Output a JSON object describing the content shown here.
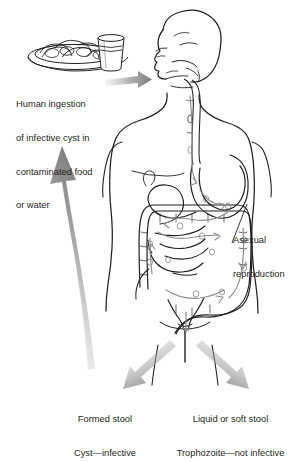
{
  "figure": {
    "background_color": "#ffffff",
    "line_color": "#231f20",
    "arrow_color": "#8d8d8d",
    "text_color": "#231f20"
  },
  "labels": {
    "ingestion": {
      "name": "human-ingestion-caption",
      "lines": [
        "Human ingestion",
        "of infective cyst in",
        "contaminated food",
        "or water"
      ]
    },
    "asexual": {
      "name": "asexual-reproduction-caption",
      "lines": [
        "Asexual",
        "reproduction"
      ]
    },
    "formed_stool": {
      "name": "formed-stool-caption",
      "lines": [
        "Formed stool",
        "Cyst—infective"
      ]
    },
    "liquid_stool": {
      "name": "liquid-stool-caption",
      "lines": [
        "Liquid or soft stool",
        "Trophozoite—not infective"
      ]
    }
  },
  "graphics": {
    "food_plate": "plate-of-food-icon",
    "water_glass": "glass-of-water-icon",
    "human_body": "human-body-outline",
    "head_profile": "head-profile-outline",
    "esophagus": "esophagus-outline",
    "stomach": "stomach-outline",
    "small_intestine": "small-intestine-outline",
    "large_intestine": "large-intestine-outline",
    "rectum": "rectum-outline",
    "ingestion_arrow": "ingestion-arrow-icon",
    "recycle_arrow": "fecal-oral-recycle-arrow-icon",
    "stool_arrow_left": "formed-stool-arrow-icon",
    "stool_arrow_right": "liquid-stool-arrow-icon",
    "leader_line": "asexual-reproduction-leader-line",
    "transit_arrows": "parasite-transit-arrows",
    "parasite_cysts": "parasite-cyst-marks"
  }
}
